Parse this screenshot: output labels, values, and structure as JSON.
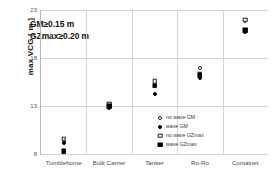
{
  "chart_data": {
    "type": "scatter",
    "title": "",
    "xlabel": "",
    "ylabel": "max VCG [ m ]",
    "ylim": [
      8,
      23
    ],
    "yticks": [
      8,
      13,
      18,
      23
    ],
    "grid": true,
    "legend_position": "inside-right",
    "categories": [
      "Tumblehome",
      "Bulk Carrier",
      "Tanker",
      "Ro-Ro",
      "Container"
    ],
    "annotations": [
      "GM≥0.15 m",
      "GZmax≥0.20 m"
    ],
    "series": [
      {
        "name": "no wave GM",
        "marker": "circle-open",
        "values": [
          9.4,
          13.2,
          15.5,
          17.0,
          21.9
        ]
      },
      {
        "name": "wave GM",
        "marker": "circle-filled",
        "values": [
          9.1,
          12.8,
          14.2,
          15.9,
          20.7
        ]
      },
      {
        "name": "no wave GZmax",
        "marker": "square-open",
        "values": [
          9.6,
          13.2,
          15.6,
          16.3,
          22.0
        ]
      },
      {
        "name": "wave GZmax",
        "marker": "square-filled",
        "values": [
          8.3,
          13.0,
          15.1,
          16.2,
          20.9
        ]
      }
    ]
  }
}
